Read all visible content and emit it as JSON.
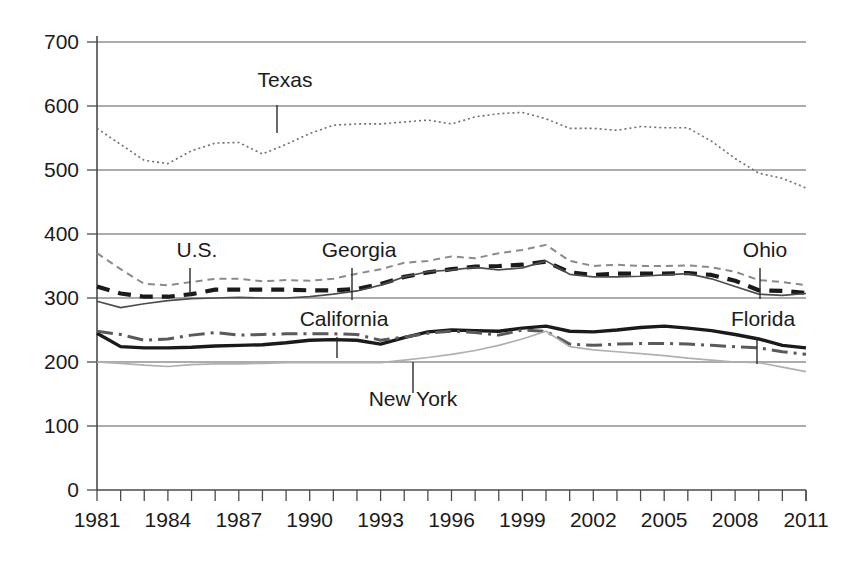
{
  "chart_data": {
    "type": "line",
    "title": "",
    "subtitle": "",
    "xlabel": "",
    "ylabel": "",
    "xlim": [
      1981,
      2011
    ],
    "ylim": [
      0,
      700
    ],
    "grid": "horizontal",
    "legend_position": "inline-annotations",
    "y_ticks": [
      0,
      100,
      200,
      300,
      400,
      500,
      600,
      700
    ],
    "y_tick_labels": [
      "0",
      "100",
      "200",
      "300",
      "400",
      "500",
      "600",
      "700"
    ],
    "x_ticks": [
      1981,
      1982,
      1983,
      1984,
      1985,
      1986,
      1987,
      1988,
      1989,
      1990,
      1991,
      1992,
      1993,
      1994,
      1995,
      1996,
      1997,
      1998,
      1999,
      2000,
      2001,
      2002,
      2003,
      2004,
      2005,
      2006,
      2007,
      2008,
      2009,
      2010,
      2011
    ],
    "x_tick_labels_shown": [
      "1981",
      "1984",
      "1987",
      "1990",
      "1993",
      "1996",
      "1999",
      "2002",
      "2005",
      "2008",
      "2011"
    ],
    "x": [
      1981,
      1982,
      1983,
      1984,
      1985,
      1986,
      1987,
      1988,
      1989,
      1990,
      1991,
      1992,
      1993,
      1994,
      1995,
      1996,
      1997,
      1998,
      1999,
      2000,
      2001,
      2002,
      2003,
      2004,
      2005,
      2006,
      2007,
      2008,
      2009,
      2010,
      2011
    ],
    "series": [
      {
        "name": "Texas",
        "label": "Texas",
        "style": "dotted",
        "color": "#6e6e6e",
        "width": 1.6,
        "dash": "2,3",
        "values": [
          565,
          540,
          515,
          510,
          530,
          542,
          543,
          525,
          540,
          557,
          570,
          572,
          572,
          575,
          578,
          572,
          583,
          588,
          590,
          580,
          565,
          565,
          562,
          568,
          566,
          566,
          545,
          518,
          495,
          487,
          472
        ]
      },
      {
        "name": "U.S.",
        "label": "U.S.",
        "style": "short-dash",
        "color": "#8a8a8a",
        "width": 2.0,
        "dash": "7,5",
        "values": [
          370,
          345,
          322,
          320,
          325,
          330,
          330,
          326,
          328,
          327,
          330,
          338,
          345,
          355,
          358,
          365,
          362,
          370,
          375,
          383,
          358,
          350,
          352,
          350,
          350,
          351,
          348,
          341,
          328,
          325,
          320
        ]
      },
      {
        "name": "Georgia",
        "label": "Georgia",
        "style": "bold-dash",
        "color": "#1a1a1a",
        "width": 4.2,
        "dash": "13,9",
        "values": [
          318,
          307,
          302,
          302,
          306,
          313,
          313,
          313,
          313,
          312,
          312,
          314,
          322,
          333,
          340,
          345,
          349,
          350,
          352,
          357,
          340,
          336,
          338,
          338,
          338,
          339,
          336,
          327,
          312,
          311,
          308
        ]
      },
      {
        "name": "Ohio",
        "label": "Ohio",
        "style": "thin-solid",
        "color": "#4d4d4d",
        "width": 1.7,
        "dash": "none",
        "values": [
          295,
          285,
          291,
          296,
          299,
          300,
          301,
          300,
          300,
          302,
          306,
          311,
          320,
          333,
          341,
          344,
          348,
          344,
          347,
          358,
          337,
          333,
          333,
          334,
          336,
          338,
          330,
          318,
          306,
          304,
          307
        ]
      },
      {
        "name": "California",
        "label": "California",
        "style": "bold-solid",
        "color": "#1a1a1a",
        "width": 3.4,
        "dash": "none",
        "values": [
          245,
          224,
          222,
          222,
          223,
          225,
          226,
          227,
          230,
          234,
          235,
          234,
          228,
          238,
          247,
          250,
          249,
          248,
          253,
          256,
          248,
          247,
          250,
          254,
          256,
          253,
          249,
          243,
          236,
          226,
          222
        ]
      },
      {
        "name": "Florida",
        "label": "Florida",
        "style": "dash-dot",
        "color": "#5a5a5a",
        "width": 3.0,
        "dash": "16,6,3,6",
        "values": [
          248,
          243,
          234,
          236,
          242,
          246,
          242,
          243,
          244,
          244,
          244,
          243,
          234,
          239,
          245,
          248,
          246,
          242,
          250,
          248,
          228,
          226,
          228,
          229,
          229,
          228,
          226,
          224,
          222,
          216,
          212
        ]
      },
      {
        "name": "New York",
        "label": "New York",
        "style": "light-thin-solid",
        "color": "#b0b0b0",
        "width": 1.7,
        "dash": "none",
        "values": [
          200,
          198,
          195,
          193,
          196,
          197,
          197,
          198,
          199,
          199,
          199,
          199,
          199,
          203,
          207,
          212,
          218,
          226,
          236,
          248,
          224,
          219,
          216,
          213,
          210,
          206,
          203,
          200,
          199,
          192,
          185
        ]
      }
    ],
    "annotations": [
      {
        "label": "Texas",
        "text_x": 285,
        "text_y": 87,
        "anchor": "middle",
        "leader_x": 277,
        "leader_y1": 105,
        "leader_y2": 133
      },
      {
        "label": "U.S.",
        "text_x": 197,
        "text_y": 257,
        "anchor": "middle",
        "leader_x": 190,
        "leader_y1": 268,
        "leader_y2": 295
      },
      {
        "label": "Georgia",
        "text_x": 359,
        "text_y": 257,
        "anchor": "middle",
        "leader_x": 352,
        "leader_y1": 268,
        "leader_y2": 300
      },
      {
        "label": "Ohio",
        "text_x": 765,
        "text_y": 257,
        "anchor": "middle",
        "leader_x": 760,
        "leader_y1": 268,
        "leader_y2": 299
      },
      {
        "label": "California",
        "text_x": 344,
        "text_y": 326,
        "anchor": "middle",
        "leader_x": 337,
        "leader_y1": 337,
        "leader_y2": 358
      },
      {
        "label": "Florida",
        "text_x": 763,
        "text_y": 326,
        "anchor": "middle",
        "leader_x": 757,
        "leader_y1": 337,
        "leader_y2": 364
      },
      {
        "label": "New York",
        "text_x": 413,
        "text_y": 406,
        "anchor": "middle",
        "leader_x": 413,
        "leader_y1": 393,
        "leader_y2": 362
      }
    ]
  },
  "axes": {
    "plot_left": 97,
    "plot_right": 806,
    "plot_top": 42,
    "plot_bottom": 490
  }
}
